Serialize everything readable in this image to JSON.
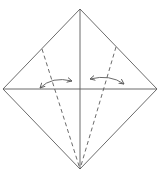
{
  "diagram": {
    "type": "origami-fold-instruction",
    "colors": {
      "background": "#ffffff",
      "line": "#5a5a5a"
    },
    "square": {
      "top": [
        80,
        9
      ],
      "right": [
        157,
        89
      ],
      "bottom": [
        80,
        169
      ],
      "left": [
        3,
        89
      ]
    },
    "creases": [
      {
        "name": "vertical-diagonal",
        "from": [
          80,
          9
        ],
        "to": [
          80,
          169
        ],
        "style": "solid"
      },
      {
        "name": "horizontal-diagonal",
        "from": [
          3,
          89
        ],
        "to": [
          157,
          89
        ],
        "style": "solid"
      }
    ],
    "fold_lines": [
      {
        "name": "left-valley-fold",
        "from": [
          42,
          49
        ],
        "to": [
          80,
          169
        ],
        "style": "dashed"
      },
      {
        "name": "right-valley-fold",
        "from": [
          116,
          47
        ],
        "to": [
          80,
          169
        ],
        "style": "dashed"
      }
    ],
    "arrows": [
      {
        "name": "left-fold-unfold-arrow",
        "from": [
          40,
          88
        ],
        "to": [
          72,
          81
        ],
        "double_headed": true
      },
      {
        "name": "right-fold-unfold-arrow",
        "from": [
          90,
          79
        ],
        "to": [
          124,
          84
        ],
        "double_headed": true
      }
    ]
  }
}
